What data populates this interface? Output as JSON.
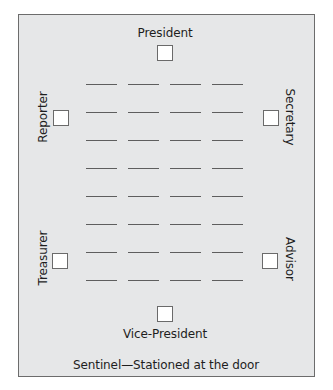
{
  "diagram": {
    "type": "meeting-room-seating-layout",
    "officers": {
      "top": {
        "label": "President"
      },
      "bottom": {
        "label": "Vice-President"
      },
      "left_upper": {
        "label": "Reporter"
      },
      "left_lower": {
        "label": "Treasurer"
      },
      "right_upper": {
        "label": "Secretary"
      },
      "right_lower": {
        "label": "Advisor"
      }
    },
    "member_seats": {
      "rows": 8,
      "columns": 4,
      "row_y": [
        84,
        112,
        140,
        168,
        196,
        224,
        252,
        280
      ],
      "col_x": [
        86,
        128,
        170,
        212
      ]
    },
    "footer": "Sentinel—Stationed at the door",
    "colors": {
      "background": "#e6e7e8",
      "border": "#6c6c6c",
      "seat_line": "#5e5e5e",
      "box_fill": "#ffffff"
    }
  }
}
